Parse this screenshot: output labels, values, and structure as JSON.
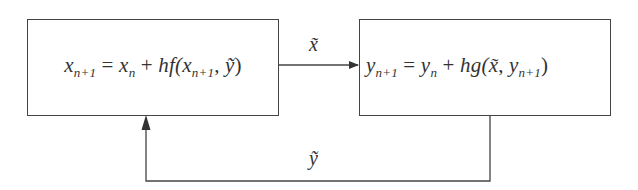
{
  "diagram": {
    "type": "block-diagram",
    "nodes": [
      {
        "id": "left-box",
        "equation": {
          "lhs_var": "x",
          "lhs_sub": "n+1",
          "eq": "=",
          "rhs_var": "x",
          "rhs_sub": "n",
          "plus": "+",
          "fn": "hf(",
          "arg1_var": "x",
          "arg1_sub": "n+1",
          "comma": ",",
          "arg2": "ỹ",
          "close": ")"
        },
        "equation_text": "x_{n+1} = x_n + hf(x_{n+1}, ỹ)"
      },
      {
        "id": "right-box",
        "equation": {
          "lhs_var": "y",
          "lhs_sub": "n+1",
          "eq": "=",
          "rhs_var": "y",
          "rhs_sub": "n",
          "plus": "+",
          "fn": "hg(",
          "arg1": "x̃",
          "comma": ",",
          "arg2_var": "y",
          "arg2_sub": "n+1",
          "close": ")"
        },
        "equation_text": "y_{n+1} = y_n + hg(x̃, y_{n+1})"
      }
    ],
    "edges": [
      {
        "from": "left-box",
        "to": "right-box",
        "label": "x̃"
      },
      {
        "from": "right-box",
        "to": "left-box",
        "label": "ỹ"
      }
    ],
    "colors": {
      "line": "#444444",
      "text": "#333333",
      "background": "#ffffff"
    }
  }
}
